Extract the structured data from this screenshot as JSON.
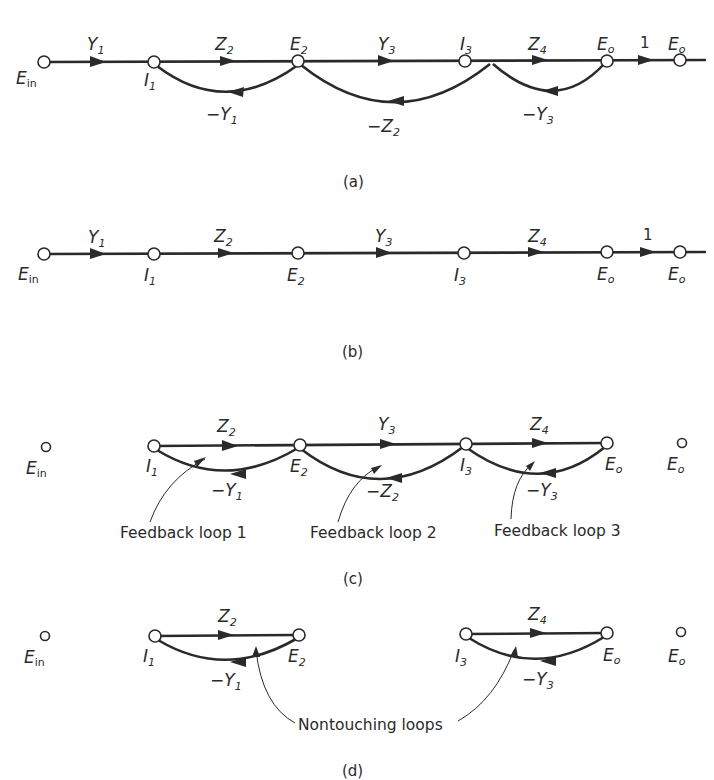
{
  "figure": {
    "panels": [
      {
        "caption": "(a)",
        "nodes": [
          "E_in",
          "I_1",
          "E_2",
          "I_3",
          "E_o",
          "E_o"
        ],
        "forward_branches": [
          "Y1",
          "Z2",
          "Y3",
          "Z4",
          "1"
        ],
        "feedback_branches": [
          "-Y1",
          "-Z2",
          "-Y3"
        ]
      },
      {
        "caption": "(b)",
        "nodes": [
          "E_in",
          "I_1",
          "E_2",
          "I_3",
          "E_o",
          "E_o"
        ],
        "forward_branches": [
          "Y1",
          "Z2",
          "Y3",
          "Z4",
          "1"
        ]
      },
      {
        "caption": "(c)",
        "nodes": [
          "E_in",
          "I_1",
          "E_2",
          "I_3",
          "E_o",
          "E_o"
        ],
        "forward_branches": [
          "Z2",
          "Y3",
          "Z4"
        ],
        "feedback_branches": [
          "-Y1",
          "-Z2",
          "-Y3"
        ],
        "annotations": [
          "Feedback loop 1",
          "Feedback loop 2",
          "Feedback loop 3"
        ]
      },
      {
        "caption": "(d)",
        "nodes": [
          "E_in",
          "I_1",
          "E_2",
          "I_3",
          "E_o",
          "E_o"
        ],
        "forward_branches": [
          "Z2",
          "Z4"
        ],
        "feedback_branches": [
          "-Y1",
          "-Y3"
        ],
        "annotations": [
          "Nontouching loops"
        ]
      }
    ],
    "labels": {
      "ein": "E",
      "ein_sub": "in",
      "i": "I",
      "e": "E",
      "y": "Y",
      "z": "Z",
      "o": "o",
      "s1": "1",
      "s2": "2",
      "s3": "3",
      "s4": "4",
      "minus": "−",
      "one": "1"
    },
    "captions": {
      "a": "(a)",
      "b": "(b)",
      "c": "(c)",
      "d": "(d)"
    },
    "annotations": {
      "loop1": "Feedback loop 1",
      "loop2": "Feedback loop 2",
      "loop3": "Feedback loop 3",
      "nontouching": "Nontouching loops"
    },
    "colors": {
      "ink": "#2a2a2a",
      "background": "#ffffff"
    }
  }
}
